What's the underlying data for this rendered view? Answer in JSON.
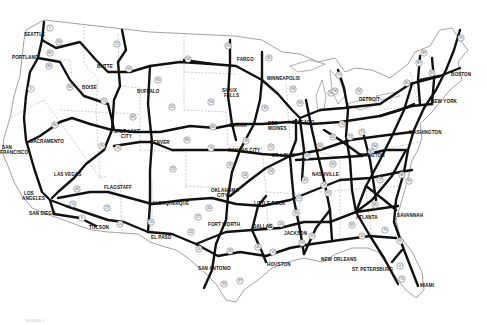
{
  "map": {
    "title": "Interstate Highway System",
    "background": "#ffffff",
    "highway_color": "#111111",
    "border_color": "#9a9a9a",
    "cities": [
      {
        "name": "SEATTLE",
        "x": 24,
        "y": 36
      },
      {
        "name": "PORTLAND",
        "x": 12,
        "y": 59
      },
      {
        "name": "BUTTE",
        "x": 97,
        "y": 68
      },
      {
        "name": "BOISE",
        "x": 82,
        "y": 89
      },
      {
        "name": "BUFFALO",
        "x": 137,
        "y": 93
      },
      {
        "name": "FARGO",
        "x": 237,
        "y": 61
      },
      {
        "name": "MINNEAPOLIS",
        "x": 267,
        "y": 80
      },
      {
        "name": "SIOUX",
        "x": 222,
        "y": 92
      },
      {
        "name": "FALLS",
        "x": 224,
        "y": 97
      },
      {
        "name": "SACRAMENTO",
        "x": 30,
        "y": 143
      },
      {
        "name": "SAN",
        "x": 2,
        "y": 149
      },
      {
        "name": "FRANCISCO",
        "x": 0,
        "y": 154
      },
      {
        "name": "SALT LAKE",
        "x": 114,
        "y": 133
      },
      {
        "name": "CITY",
        "x": 121,
        "y": 138
      },
      {
        "name": "DENVER",
        "x": 150,
        "y": 144
      },
      {
        "name": "OMAHA",
        "x": 229,
        "y": 127
      },
      {
        "name": "DES",
        "x": 268,
        "y": 125
      },
      {
        "name": "MOINES",
        "x": 268,
        "y": 130
      },
      {
        "name": "CHICAGO",
        "x": 292,
        "y": 124
      },
      {
        "name": "DETROIT",
        "x": 359,
        "y": 101
      },
      {
        "name": "BOSTON",
        "x": 451,
        "y": 76
      },
      {
        "name": "NEW YORK",
        "x": 431,
        "y": 103
      },
      {
        "name": "WASHINGTON",
        "x": 409,
        "y": 134
      },
      {
        "name": "KANSAS CITY",
        "x": 228,
        "y": 152
      },
      {
        "name": "ST. LOUIS",
        "x": 272,
        "y": 157
      },
      {
        "name": "LEXINGTON",
        "x": 357,
        "y": 157
      },
      {
        "name": "LAS VEGAS",
        "x": 54,
        "y": 176
      },
      {
        "name": "FLAGSTAFF",
        "x": 104,
        "y": 189
      },
      {
        "name": "LOS",
        "x": 24,
        "y": 195
      },
      {
        "name": "ANGELES",
        "x": 22,
        "y": 200
      },
      {
        "name": "ALBUQUERQUE",
        "x": 152,
        "y": 205
      },
      {
        "name": "OKLAHOMA",
        "x": 211,
        "y": 192
      },
      {
        "name": "CITY",
        "x": 217,
        "y": 197
      },
      {
        "name": "LITTLE ROCK",
        "x": 254,
        "y": 205
      },
      {
        "name": "NASHVILLE",
        "x": 312,
        "y": 176
      },
      {
        "name": "ATLANTA",
        "x": 356,
        "y": 219
      },
      {
        "name": "SAN DIEGO",
        "x": 29,
        "y": 215
      },
      {
        "name": "TUCSON",
        "x": 89,
        "y": 229
      },
      {
        "name": "EL PASO",
        "x": 151,
        "y": 239
      },
      {
        "name": "FORT WORTH",
        "x": 208,
        "y": 226
      },
      {
        "name": "DALLAS",
        "x": 253,
        "y": 228
      },
      {
        "name": "JACKSON",
        "x": 284,
        "y": 235
      },
      {
        "name": "SAVANNAH",
        "x": 397,
        "y": 217
      },
      {
        "name": "SAN ANTONIO",
        "x": 198,
        "y": 270
      },
      {
        "name": "HOUSTON",
        "x": 267,
        "y": 266
      },
      {
        "name": "NEW ORLEANS",
        "x": 321,
        "y": 261
      },
      {
        "name": "ST. PETERSBURG",
        "x": 352,
        "y": 271
      },
      {
        "name": "MIAMI",
        "x": 420,
        "y": 287
      }
    ],
    "shields": [
      {
        "n": "5",
        "x": 50,
        "y": 28
      },
      {
        "n": "90",
        "x": 59,
        "y": 42
      },
      {
        "n": "82",
        "x": 50,
        "y": 53
      },
      {
        "n": "84",
        "x": 49,
        "y": 66
      },
      {
        "n": "15",
        "x": 117,
        "y": 44
      },
      {
        "n": "90",
        "x": 129,
        "y": 69
      },
      {
        "n": "5",
        "x": 31,
        "y": 89
      },
      {
        "n": "80",
        "x": 70,
        "y": 87
      },
      {
        "n": "15",
        "x": 104,
        "y": 101
      },
      {
        "n": "29",
        "x": 228,
        "y": 46
      },
      {
        "n": "94",
        "x": 188,
        "y": 59
      },
      {
        "n": "90",
        "x": 158,
        "y": 80
      },
      {
        "n": "35",
        "x": 269,
        "y": 58
      },
      {
        "n": "94",
        "x": 293,
        "y": 89
      },
      {
        "n": "90",
        "x": 211,
        "y": 102
      },
      {
        "n": "25",
        "x": 172,
        "y": 107
      },
      {
        "n": "90",
        "x": 300,
        "y": 103
      },
      {
        "n": "35",
        "x": 265,
        "y": 108
      },
      {
        "n": "75",
        "x": 339,
        "y": 75
      },
      {
        "n": "94",
        "x": 359,
        "y": 91
      },
      {
        "n": "90",
        "x": 331,
        "y": 93
      },
      {
        "n": "96",
        "x": 335,
        "y": 91
      },
      {
        "n": "87",
        "x": 419,
        "y": 63
      },
      {
        "n": "89",
        "x": 424,
        "y": 53
      },
      {
        "n": "95",
        "x": 461,
        "y": 38
      },
      {
        "n": "91",
        "x": 432,
        "y": 73
      },
      {
        "n": "81",
        "x": 407,
        "y": 83
      },
      {
        "n": "80",
        "x": 55,
        "y": 125
      },
      {
        "n": "80",
        "x": 133,
        "y": 117
      },
      {
        "n": "15",
        "x": 102,
        "y": 146
      },
      {
        "n": "70",
        "x": 118,
        "y": 148
      },
      {
        "n": "80",
        "x": 213,
        "y": 127
      },
      {
        "n": "80",
        "x": 187,
        "y": 140
      },
      {
        "n": "70",
        "x": 211,
        "y": 148
      },
      {
        "n": "29",
        "x": 246,
        "y": 141
      },
      {
        "n": "35",
        "x": 230,
        "y": 165
      },
      {
        "n": "44",
        "x": 245,
        "y": 175
      },
      {
        "n": "55",
        "x": 271,
        "y": 147
      },
      {
        "n": "44",
        "x": 271,
        "y": 171
      },
      {
        "n": "25",
        "x": 173,
        "y": 169
      },
      {
        "n": "40",
        "x": 77,
        "y": 189
      },
      {
        "n": "17",
        "x": 107,
        "y": 208
      },
      {
        "n": "10",
        "x": 73,
        "y": 204
      },
      {
        "n": "8",
        "x": 82,
        "y": 218
      },
      {
        "n": "10",
        "x": 120,
        "y": 224
      },
      {
        "n": "25",
        "x": 151,
        "y": 222
      },
      {
        "n": "40",
        "x": 209,
        "y": 208
      },
      {
        "n": "27",
        "x": 198,
        "y": 217
      },
      {
        "n": "20",
        "x": 191,
        "y": 232
      },
      {
        "n": "10",
        "x": 199,
        "y": 249
      },
      {
        "n": "35",
        "x": 230,
        "y": 251
      },
      {
        "n": "45",
        "x": 258,
        "y": 247
      },
      {
        "n": "10",
        "x": 273,
        "y": 252
      },
      {
        "n": "30",
        "x": 270,
        "y": 227
      },
      {
        "n": "20",
        "x": 281,
        "y": 224
      },
      {
        "n": "59",
        "x": 302,
        "y": 243
      },
      {
        "n": "55",
        "x": 312,
        "y": 236
      },
      {
        "n": "37",
        "x": 240,
        "y": 281
      },
      {
        "n": "35",
        "x": 224,
        "y": 284
      },
      {
        "n": "75",
        "x": 385,
        "y": 230
      },
      {
        "n": "95",
        "x": 400,
        "y": 241
      },
      {
        "n": "4",
        "x": 400,
        "y": 266
      },
      {
        "n": "75",
        "x": 402,
        "y": 279
      },
      {
        "n": "10",
        "x": 362,
        "y": 236
      },
      {
        "n": "65",
        "x": 352,
        "y": 225
      },
      {
        "n": "85",
        "x": 375,
        "y": 205
      },
      {
        "n": "77",
        "x": 380,
        "y": 180
      },
      {
        "n": "81",
        "x": 371,
        "y": 152
      },
      {
        "n": "64",
        "x": 375,
        "y": 146
      },
      {
        "n": "95",
        "x": 409,
        "y": 181
      },
      {
        "n": "85",
        "x": 402,
        "y": 175
      },
      {
        "n": "70",
        "x": 342,
        "y": 124
      },
      {
        "n": "75",
        "x": 350,
        "y": 137
      },
      {
        "n": "65",
        "x": 333,
        "y": 137
      },
      {
        "n": "71",
        "x": 362,
        "y": 132
      },
      {
        "n": "24",
        "x": 324,
        "y": 185
      },
      {
        "n": "40",
        "x": 333,
        "y": 164
      },
      {
        "n": "65",
        "x": 328,
        "y": 193
      },
      {
        "n": "57",
        "x": 307,
        "y": 156
      },
      {
        "n": "64",
        "x": 320,
        "y": 146
      },
      {
        "n": "55",
        "x": 299,
        "y": 198
      },
      {
        "n": "40",
        "x": 305,
        "y": 180
      },
      {
        "n": "30",
        "x": 296,
        "y": 213
      }
    ],
    "footer_caption": "FIGURE 1"
  }
}
